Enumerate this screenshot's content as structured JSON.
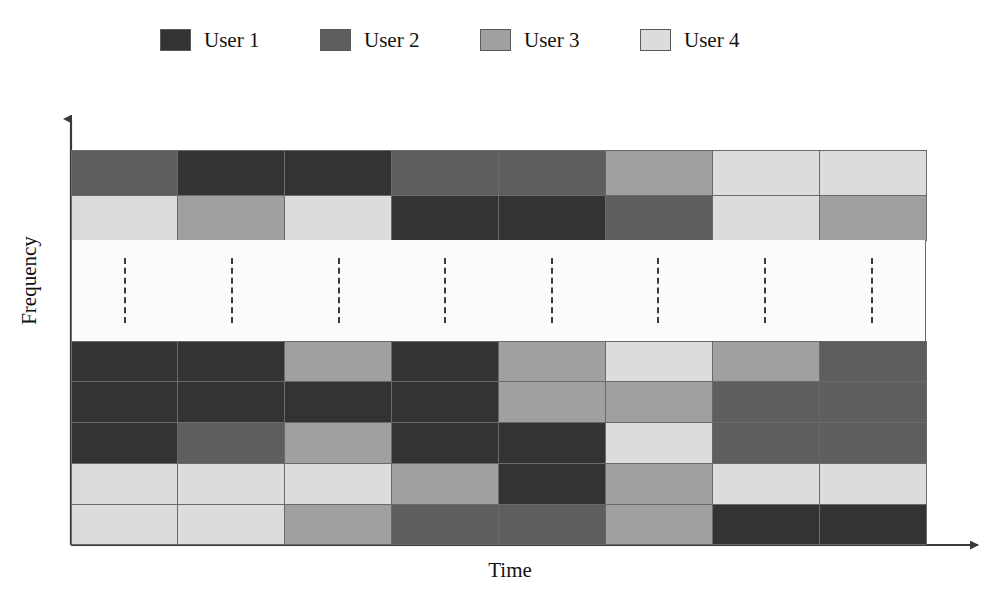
{
  "legend": {
    "entries": [
      {
        "label": "User 1",
        "color": "#333336"
      },
      {
        "label": "User 2",
        "color": "#5e5e60"
      },
      {
        "label": "User 3",
        "color": "#a0a0a2"
      },
      {
        "label": "User 4",
        "color": "#dcdcdc"
      }
    ]
  },
  "axes": {
    "xlabel": "Time",
    "ylabel": "Frequency"
  },
  "chart_data": {
    "type": "heatmap",
    "title": "",
    "xlabel": "Time",
    "ylabel": "Frequency",
    "grid": true,
    "legend_position": "top",
    "categories": [
      "t1",
      "t2",
      "t3",
      "t4",
      "t5",
      "t6",
      "t7",
      "t8"
    ],
    "users": [
      "User 1",
      "User 2",
      "User 3",
      "User 4"
    ],
    "colors": {
      "User 1": "#333336",
      "User 2": "#5e5e60",
      "User 3": "#a0a0a2",
      "User 4": "#dcdcdc"
    },
    "top_block_rows": [
      [
        "User 2",
        "User 1",
        "User 1",
        "User 2",
        "User 2",
        "User 3",
        "User 4",
        "User 4"
      ],
      [
        "User 4",
        "User 3",
        "User 4",
        "User 1",
        "User 1",
        "User 2",
        "User 4",
        "User 3"
      ]
    ],
    "gap_block": {
      "style": "dashed-vertical-ellipsis",
      "columns": 8
    },
    "bottom_block_rows": [
      [
        "User 1",
        "User 1",
        "User 3",
        "User 1",
        "User 3",
        "User 4",
        "User 3",
        "User 2"
      ],
      [
        "User 1",
        "User 1",
        "User 1",
        "User 1",
        "User 3",
        "User 3",
        "User 2",
        "User 2"
      ],
      [
        "User 1",
        "User 2",
        "User 3",
        "User 1",
        "User 1",
        "User 4",
        "User 2",
        "User 2"
      ],
      [
        "User 4",
        "User 4",
        "User 4",
        "User 3",
        "User 1",
        "User 3",
        "User 4",
        "User 4"
      ],
      [
        "User 4",
        "User 4",
        "User 3",
        "User 2",
        "User 2",
        "User 3",
        "User 1",
        "User 1"
      ]
    ]
  }
}
